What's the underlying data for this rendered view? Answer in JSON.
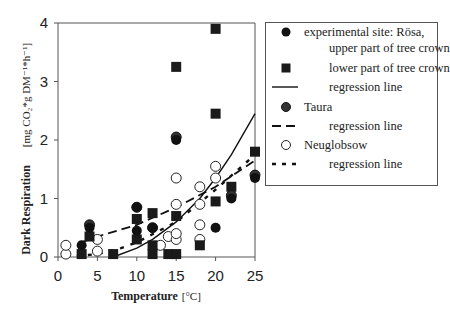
{
  "chart_data": {
    "type": "scatter",
    "title": "",
    "xlabel": "Temperature [°C]",
    "ylabel": "Dark Respiration",
    "ylabel_units": "[mg CO2 * gDM^-1 * h^-1]",
    "xlim": [
      0,
      25
    ],
    "ylim": [
      0,
      4
    ],
    "x_ticks": [
      0,
      5,
      10,
      15,
      20,
      25
    ],
    "y_ticks": [
      0,
      1,
      2,
      3,
      4
    ],
    "grid": false,
    "legend_position": "right, outside plot",
    "series": [
      {
        "name": "experimental site: Rösa, upper part of tree crown",
        "marker": "filled-circle",
        "points": [
          [
            3,
            0.2
          ],
          [
            4,
            0.5
          ],
          [
            10,
            0.85
          ],
          [
            10,
            0.45
          ],
          [
            12,
            0.5
          ],
          [
            15,
            2.0
          ],
          [
            20,
            0.5
          ],
          [
            22,
            1.0
          ],
          [
            25,
            1.35
          ]
        ]
      },
      {
        "name": "lower part of tree crown",
        "marker": "filled-square",
        "points": [
          [
            3,
            0.05
          ],
          [
            4,
            0.35
          ],
          [
            7,
            0.05
          ],
          [
            10,
            0.3
          ],
          [
            10,
            0.65
          ],
          [
            12,
            0.75
          ],
          [
            12,
            0.2
          ],
          [
            12,
            0.05
          ],
          [
            14,
            0.05
          ],
          [
            15,
            0.7
          ],
          [
            15,
            0.05
          ],
          [
            15,
            3.25
          ],
          [
            18,
            0.2
          ],
          [
            20,
            3.9
          ],
          [
            20,
            2.45
          ],
          [
            20,
            0.95
          ],
          [
            22,
            1.2
          ],
          [
            25,
            1.8
          ]
        ]
      },
      {
        "name": "Taura",
        "marker": "dark-circle",
        "points": [
          [
            4,
            0.55
          ],
          [
            10,
            0.85
          ],
          [
            12,
            0.5
          ],
          [
            15,
            2.05
          ],
          [
            22,
            1.05
          ],
          [
            25,
            1.4
          ]
        ]
      },
      {
        "name": "Neuglobsow",
        "marker": "open-circle",
        "points": [
          [
            1,
            0.05
          ],
          [
            1,
            0.2
          ],
          [
            5,
            0.3
          ],
          [
            5,
            0.1
          ],
          [
            13,
            0.2
          ],
          [
            14,
            0.35
          ],
          [
            15,
            0.3
          ],
          [
            15,
            1.35
          ],
          [
            15,
            0.9
          ],
          [
            15,
            0.4
          ],
          [
            18,
            1.2
          ],
          [
            18,
            0.9
          ],
          [
            18,
            0.3
          ],
          [
            18,
            0.55
          ],
          [
            20,
            1.55
          ],
          [
            20,
            1.35
          ]
        ]
      }
    ],
    "regression_lines": [
      {
        "name": "Rösa regression line",
        "style": "solid",
        "points": [
          [
            7,
            0.0
          ],
          [
            10,
            0.15
          ],
          [
            12,
            0.3
          ],
          [
            15,
            0.6
          ],
          [
            18,
            1.0
          ],
          [
            20,
            1.35
          ],
          [
            22,
            1.75
          ],
          [
            25,
            2.45
          ]
        ]
      },
      {
        "name": "Taura regression line",
        "style": "long-dash",
        "points": [
          [
            3,
            0.25
          ],
          [
            5,
            0.35
          ],
          [
            10,
            0.55
          ],
          [
            15,
            0.85
          ],
          [
            20,
            1.2
          ],
          [
            25,
            1.65
          ]
        ]
      },
      {
        "name": "Neuglobsow regression line",
        "style": "short-dash",
        "points": [
          [
            1,
            0.0
          ],
          [
            5,
            0.05
          ],
          [
            8,
            0.15
          ],
          [
            10,
            0.25
          ],
          [
            15,
            0.6
          ],
          [
            20,
            1.15
          ],
          [
            25,
            1.75
          ]
        ]
      }
    ]
  },
  "axes": {
    "x_ticks": [
      "0",
      "5",
      "10",
      "15",
      "20",
      "25"
    ],
    "y_ticks": [
      "0",
      "1",
      "2",
      "3",
      "4"
    ],
    "x_title": "Temperature",
    "x_unit": "[°C]",
    "y_title": "Dark Respiration",
    "y_unit": "[mg CO₂*g DM⁻¹*h⁻¹]"
  },
  "legend": {
    "rows": [
      {
        "symbol": "filled-circle",
        "text": "experimental site: Rösa,"
      },
      {
        "symbol": "none",
        "text": "upper part of tree crown"
      },
      {
        "symbol": "filled-square",
        "text": "lower part of tree crown"
      },
      {
        "symbol": "solid-line",
        "text": "regression line"
      },
      {
        "symbol": "dark-circle",
        "text": "Taura"
      },
      {
        "symbol": "long-dash-line",
        "text": "regression line"
      },
      {
        "symbol": "open-circle",
        "text": "Neuglobsow"
      },
      {
        "symbol": "short-dash-line",
        "text": "regression line"
      }
    ]
  }
}
